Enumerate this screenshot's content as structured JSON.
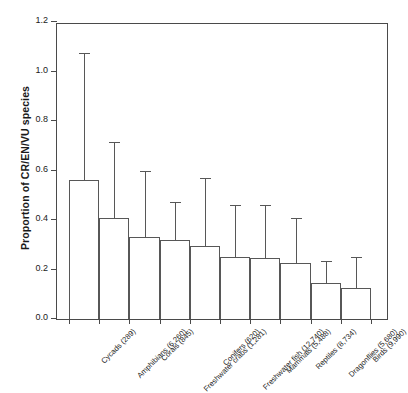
{
  "chart_data": {
    "type": "bar",
    "title": "",
    "subtitle": "",
    "xlabel": "",
    "ylabel": "Proportion of CR/EN/VU species",
    "ylim": [
      0.0,
      1.2
    ],
    "ytick_labels": [
      "0.0",
      "0.2",
      "0.4",
      "0.6",
      "0.8",
      "1.0",
      "1.2"
    ],
    "ytick_values": [
      0.0,
      0.2,
      0.4,
      0.6,
      0.8,
      1.0,
      1.2
    ],
    "grid": false,
    "legend": "none",
    "error_bars": "upper-only",
    "bar_facecolor": "#ffffff",
    "bar_edgecolor": "#575757",
    "axis_color": "#4a4a4a",
    "categories": [
      "Cycads (289)",
      "Amphibians (6,260)",
      "Corals (845)",
      "Freshwater crabs (1,281)",
      "Conifers (620)",
      "Freshwater fish (12,740)",
      "Mammals (5,488)",
      "Reptiles (8,734)",
      "Dragonflies (5,680)",
      "Birds (9,990)"
    ],
    "group_names": [
      "Cycads",
      "Amphibians",
      "Corals",
      "Freshwater crabs",
      "Conifers",
      "Freshwater fish",
      "Mammals",
      "Reptiles",
      "Dragonflies",
      "Birds"
    ],
    "species_counts": [
      "289",
      "6,260",
      "845",
      "1,281",
      "620",
      "12,740",
      "5,488",
      "8,734",
      "5,680",
      "9,990"
    ],
    "values": [
      0.56,
      0.41,
      0.33,
      0.32,
      0.295,
      0.25,
      0.245,
      0.225,
      0.145,
      0.125
    ],
    "error_upper": [
      1.07,
      0.71,
      0.595,
      0.47,
      0.565,
      0.455,
      0.455,
      0.405,
      0.23,
      0.245
    ],
    "series": [
      {
        "name": "Proportion of CR/EN/VU species",
        "values": [
          0.56,
          0.41,
          0.33,
          0.32,
          0.295,
          0.25,
          0.245,
          0.225,
          0.145,
          0.125
        ],
        "error_upper": [
          1.07,
          0.71,
          0.595,
          0.47,
          0.565,
          0.455,
          0.455,
          0.405,
          0.23,
          0.245
        ]
      }
    ]
  }
}
